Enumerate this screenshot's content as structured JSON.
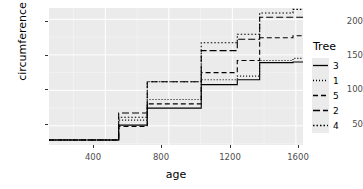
{
  "chart_data": {
    "type": "line",
    "subtype": "step",
    "title": "",
    "xlabel": "age",
    "ylabel": "circumference",
    "xlim": [
      45,
      1645
    ],
    "ylim": [
      23,
      216
    ],
    "xticks": [
      400,
      800,
      1200,
      1600
    ],
    "xtick_labels": [
      "400",
      "800",
      "1200",
      "1600"
    ],
    "yticks": [
      50,
      100,
      150,
      200
    ],
    "ytick_labels": [
      "50",
      "100",
      "150",
      "200"
    ],
    "grid": true,
    "legend_position": "right",
    "legend_title": "Tree",
    "x": [
      118,
      484,
      664,
      1004,
      1231,
      1372,
      1582
    ],
    "series": [
      {
        "name": "3",
        "linetype": "solid",
        "dasharray": "",
        "values": [
          30,
          51,
          75,
          108,
          115,
          139,
          140
        ]
      },
      {
        "name": "1",
        "linetype": "dotted",
        "dasharray": "1,2",
        "values": [
          30,
          58,
          87,
          115,
          120,
          142,
          145
        ]
      },
      {
        "name": "5",
        "linetype": "dashed",
        "dasharray": "5,3",
        "values": [
          30,
          49,
          81,
          125,
          142,
          174,
          177
        ]
      },
      {
        "name": "2",
        "linetype": "longdash",
        "dasharray": "7,3",
        "values": [
          30,
          68,
          112,
          156,
          172,
          203,
          203
        ]
      },
      {
        "name": "4",
        "linetype": "dotdash",
        "dasharray": "1.5,2",
        "values": [
          30,
          62,
          112,
          167,
          179,
          209,
          214
        ]
      }
    ],
    "legend_entries": [
      {
        "label": "3",
        "linetype": "solid"
      },
      {
        "label": "1",
        "linetype": "dotted"
      },
      {
        "label": "5",
        "linetype": "dashed"
      },
      {
        "label": "2",
        "linetype": "longdash"
      },
      {
        "label": "4",
        "linetype": "dotdash"
      }
    ],
    "colors": {
      "panel_background": "#ebebeb",
      "grid_major": "#ffffff",
      "grid_minor": "#f5f5f5",
      "line": "#000000",
      "tick_label": "#4d4d4d",
      "axis_title": "#000000"
    }
  }
}
